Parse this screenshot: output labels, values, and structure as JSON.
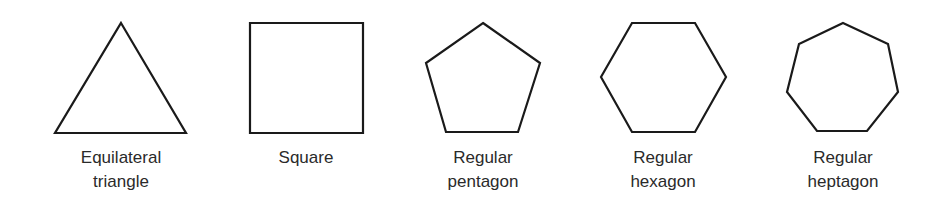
{
  "figure": {
    "stroke_color": "#1a1a1a",
    "text_color": "#2a2a2a",
    "shapes": [
      {
        "name": "equilateral-triangle",
        "label_line1": "Equilateral",
        "label_line2": "triangle",
        "points": "121,23 186,133 55,133"
      },
      {
        "name": "square",
        "label_line1": "Square",
        "label_line2": "",
        "points": "250,23 363,23 363,133 250,133"
      },
      {
        "name": "regular-pentagon",
        "label_line1": "Regular",
        "label_line2": "pentagon",
        "points": "483,23 540,63 518,132 446,132 426,63"
      },
      {
        "name": "regular-hexagon",
        "label_line1": "Regular",
        "label_line2": "hexagon",
        "points": "632,23 695,23 726,77 695,132 632,132 601,77"
      },
      {
        "name": "regular-heptagon",
        "label_line1": "Regular",
        "label_line2": "heptagon",
        "points": "843,23 888,44 898,92 867,131 817,131 787,92 799,44"
      }
    ]
  }
}
